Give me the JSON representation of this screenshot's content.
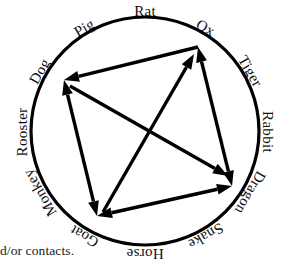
{
  "figure": {
    "caption_fragment": "d/or contacts.",
    "circle": {
      "center_x": 145,
      "center_y": 131,
      "radius": 114,
      "stroke_color": "#000000",
      "stroke_width": 3.2
    },
    "labels": [
      {
        "name": "rat",
        "text": "Rat",
        "angle_deg": -90,
        "x": 145,
        "y": 13,
        "rotate": 0,
        "anchor": "middle"
      },
      {
        "name": "ox",
        "text": "Ox",
        "angle_deg": -60,
        "x": 205,
        "y": 29,
        "rotate": 30,
        "anchor": "middle"
      },
      {
        "name": "tiger",
        "text": "Tiger",
        "angle_deg": -30,
        "x": 249,
        "y": 72,
        "rotate": 60,
        "anchor": "middle"
      },
      {
        "name": "rabbit",
        "text": "Rabbit",
        "angle_deg": 0,
        "x": 266,
        "y": 132,
        "rotate": 90,
        "anchor": "middle"
      },
      {
        "name": "dragon",
        "text": "Dragon",
        "angle_deg": 30,
        "x": 249,
        "y": 192,
        "rotate": 120,
        "anchor": "middle"
      },
      {
        "name": "snake",
        "text": "Snake",
        "angle_deg": 60,
        "x": 205,
        "y": 235,
        "rotate": 150,
        "anchor": "middle"
      },
      {
        "name": "horse",
        "text": "Horse",
        "angle_deg": 90,
        "x": 145,
        "y": 252,
        "rotate": 180,
        "anchor": "middle"
      },
      {
        "name": "goat",
        "text": "Goat",
        "angle_deg": 120,
        "x": 85,
        "y": 235,
        "rotate": 210,
        "anchor": "middle"
      },
      {
        "name": "monkey",
        "text": "Monkey",
        "angle_deg": 150,
        "x": 41,
        "y": 192,
        "rotate": 240,
        "anchor": "middle"
      },
      {
        "name": "rooster",
        "text": "Rooster",
        "angle_deg": 180,
        "x": 24,
        "y": 132,
        "rotate": 270,
        "anchor": "middle"
      },
      {
        "name": "dog",
        "text": "Dog",
        "angle_deg": 210,
        "x": 41,
        "y": 72,
        "rotate": 300,
        "anchor": "middle"
      },
      {
        "name": "pig",
        "text": "Pig",
        "angle_deg": 240,
        "x": 85,
        "y": 29,
        "rotate": 330,
        "anchor": "middle"
      }
    ],
    "vertices": [
      {
        "name": "upper-left-vertex",
        "x": 64,
        "y": 80
      },
      {
        "name": "upper-right-vertex",
        "x": 198,
        "y": 47
      },
      {
        "name": "right-vertex",
        "x": 232,
        "y": 186
      },
      {
        "name": "bottom-vertex",
        "x": 97,
        "y": 216
      }
    ],
    "arrows": [
      {
        "name": "arrow-ox-to-dog",
        "x1": 198,
        "y1": 47,
        "x2": 64,
        "y2": 80,
        "head_start": false,
        "head_end": true
      },
      {
        "name": "arrow-dog-to-goat",
        "x1": 64,
        "y1": 80,
        "x2": 97,
        "y2": 216,
        "head_start": true,
        "head_end": true
      },
      {
        "name": "arrow-goat-to-dragon",
        "x1": 97,
        "y1": 216,
        "x2": 232,
        "y2": 186,
        "head_start": true,
        "head_end": true
      },
      {
        "name": "arrow-dragon-to-ox",
        "x1": 232,
        "y1": 186,
        "x2": 198,
        "y2": 47,
        "head_start": true,
        "head_end": true
      },
      {
        "name": "arrow-diagonal-dog-dragon",
        "x1": 70,
        "y1": 86,
        "x2": 228,
        "y2": 176,
        "head_start": false,
        "head_end": true
      },
      {
        "name": "arrow-diagonal-goat-ox",
        "x1": 103,
        "y1": 212,
        "x2": 194,
        "y2": 54,
        "head_start": false,
        "head_end": true
      }
    ]
  }
}
